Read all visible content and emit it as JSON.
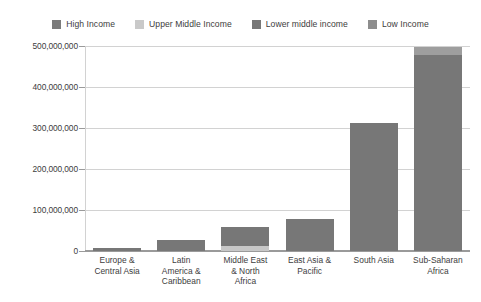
{
  "chart_data": {
    "type": "bar",
    "title": "",
    "subtitle": "",
    "xlabel": "",
    "ylabel": "",
    "stacked": true,
    "grid": true,
    "legend_position": "top-center",
    "ylim": [
      0,
      500000000
    ],
    "yticks": [
      0,
      100000000,
      200000000,
      300000000,
      400000000,
      500000000
    ],
    "ytick_labels": [
      "0",
      "100,000,000",
      "200,000,000",
      "300,000,000",
      "400,000,000",
      "500,000,000"
    ],
    "categories": [
      "Europe &\nCentral Asia",
      "Latin\nAmerica &\nCaribbean",
      "Middle East\n& North\nAfrica",
      "East Asia &\nPacific",
      "South Asia",
      "Sub-Saharan\nAfrica"
    ],
    "series": [
      {
        "name": "High Income",
        "color": "#7b7b7b",
        "values": [
          0,
          0,
          0,
          0,
          0,
          0
        ]
      },
      {
        "name": "Upper Middle Income",
        "color": "#c7c7c7",
        "values": [
          0,
          0,
          12000000,
          0,
          0,
          0
        ]
      },
      {
        "name": "Lower middle income",
        "color": "#777777",
        "values": [
          8000000,
          27000000,
          46000000,
          78000000,
          312000000,
          478000000
        ]
      },
      {
        "name": "Low Income",
        "color": "#9e9e9e",
        "values": [
          0,
          0,
          0,
          0,
          0,
          19000000
        ]
      }
    ],
    "totals": [
      8000000,
      27000000,
      58000000,
      78000000,
      312000000,
      497000000
    ]
  },
  "legend": {
    "items": [
      {
        "label": "High Income",
        "color": "#7b7b7b"
      },
      {
        "label": "Upper Middle Income",
        "color": "#c9c9c9"
      },
      {
        "label": "Lower middle income",
        "color": "#777777"
      },
      {
        "label": "Low Income",
        "color": "#8d8d8d"
      }
    ]
  },
  "axes": {
    "y": {
      "labels": [
        "500,000,000",
        "400,000,000",
        "300,000,000",
        "200,000,000",
        "100,000,000",
        "0"
      ]
    },
    "x": {
      "labels": [
        [
          "Europe &",
          "Central Asia"
        ],
        [
          "Latin",
          "America &",
          "Caribbean"
        ],
        [
          "Middle East",
          "& North",
          "Africa"
        ],
        [
          "East Asia &",
          "Pacific"
        ],
        [
          "South Asia"
        ],
        [
          "Sub-Saharan",
          "Africa"
        ]
      ]
    }
  },
  "style": {
    "gridline_color": "#d2d2d2",
    "axis_color": "#9a9a9a",
    "text_color": "#3d3d3d",
    "background": "#ffffff"
  }
}
